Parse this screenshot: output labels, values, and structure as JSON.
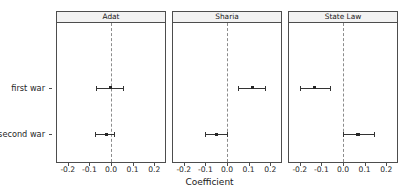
{
  "chart_data": {
    "type": "scatter",
    "title": "",
    "xlabel": "Coefficient",
    "ylabel": "",
    "xlim": [
      -0.25,
      0.25
    ],
    "xticks": [
      -0.2,
      -0.1,
      0.0,
      0.1,
      0.2
    ],
    "xticklabels": [
      "-0.2",
      "-0.1",
      "0.0",
      "0.1",
      "0.2"
    ],
    "categories": [
      "first war",
      "second war"
    ],
    "grid": false,
    "legend": "none",
    "zero_reference_line": 0.0,
    "facets": [
      {
        "label": "Adat",
        "points": [
          {
            "category": "first war",
            "estimate": -0.002,
            "low": -0.07,
            "high": 0.056
          },
          {
            "category": "second war",
            "estimate": -0.022,
            "low": -0.076,
            "high": 0.012
          }
        ]
      },
      {
        "label": "Sharia",
        "points": [
          {
            "category": "first war",
            "estimate": 0.118,
            "low": 0.052,
            "high": 0.178
          },
          {
            "category": "second war",
            "estimate": -0.05,
            "low": -0.102,
            "high": 0.002
          }
        ]
      },
      {
        "label": "State Law",
        "points": [
          {
            "category": "first war",
            "estimate": -0.132,
            "low": -0.2,
            "high": -0.062
          },
          {
            "category": "second war",
            "estimate": 0.07,
            "low": 0.0,
            "high": 0.142
          }
        ]
      }
    ]
  },
  "colors": {
    "point": "#262626",
    "errorbar": "#333333",
    "zero_line": "#8c8c8c",
    "panel_border": "#4d4d4d",
    "strip_background": "#f2f2f2",
    "background": "#ffffff"
  }
}
